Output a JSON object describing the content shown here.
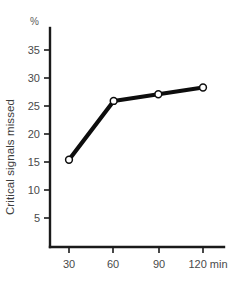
{
  "chart_data": {
    "type": "line",
    "title": "",
    "xlabel": "",
    "ylabel": "Critical signals missed",
    "y_unit": "%",
    "x_unit": "min",
    "x": [
      30,
      60,
      90,
      120
    ],
    "values": [
      15.4,
      25.9,
      27.1,
      28.3
    ],
    "xtick_labels": [
      "30",
      "60",
      "90",
      "120 min"
    ],
    "ytick_labels": [
      "5",
      "10",
      "15",
      "20",
      "25",
      "30",
      "35"
    ],
    "yticks": [
      5,
      10,
      15,
      20,
      25,
      30,
      35
    ],
    "xlim": [
      15,
      135
    ],
    "ylim": [
      0,
      38
    ],
    "grid": false,
    "legend": null,
    "marker": "open-circle",
    "line_color": "#0d0d0d",
    "marker_fill": "#ffffff",
    "background": "#ffffff"
  },
  "axes": {
    "y_unit_label": "%",
    "y_title": "Critical signals missed",
    "x_ticks": [
      {
        "label": "30"
      },
      {
        "label": "60"
      },
      {
        "label": "90"
      },
      {
        "label": "120 min"
      }
    ],
    "y_ticks": [
      {
        "label": "35"
      },
      {
        "label": "30"
      },
      {
        "label": "25"
      },
      {
        "label": "20"
      },
      {
        "label": "15"
      },
      {
        "label": "10"
      },
      {
        "label": "5"
      }
    ]
  }
}
